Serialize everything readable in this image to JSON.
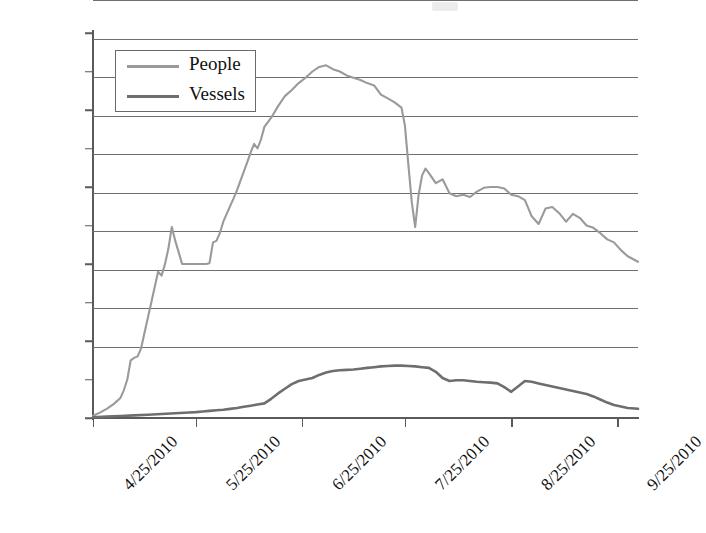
{
  "chart_data": {
    "type": "line",
    "title": "",
    "xlabel": "",
    "ylabel": "",
    "ylim": [
      0,
      50000
    ],
    "ytick_labels": [
      "50000",
      "45000",
      "40000",
      "35000",
      "30000",
      "25000",
      "20000",
      "15000",
      "10000",
      "5000",
      "0"
    ],
    "ytick_values": [
      50000,
      45000,
      40000,
      35000,
      30000,
      25000,
      20000,
      15000,
      10000,
      5000,
      0
    ],
    "xtick_labels": [
      "4/25/2010",
      "5/25/2010",
      "6/25/2010",
      "7/25/2010",
      "8/25/2010",
      "9/25/2010"
    ],
    "xtick_days": [
      0,
      30,
      61,
      91,
      122,
      153
    ],
    "x_range_days": [
      0,
      159
    ],
    "grid": "horizontal",
    "legend_position": "upper-left-inside",
    "legend_entries": [
      "People",
      "Vessels"
    ],
    "colors": {
      "people": "#9a9a9a",
      "vessels": "#6e6e6e",
      "grid": "#6f6f6f",
      "axis": "#5a5a5a"
    },
    "series": [
      {
        "name": "People",
        "color": "#9a9a9a",
        "x": [
          0,
          2,
          4,
          6,
          8,
          9,
          10,
          11,
          12,
          13,
          14,
          15,
          16,
          17,
          18,
          19,
          20,
          21,
          22,
          23,
          24,
          25,
          26,
          27,
          28,
          29,
          30,
          31,
          32,
          33,
          34,
          35,
          36,
          37,
          38,
          39,
          40,
          41,
          42,
          43,
          44,
          45,
          46,
          47,
          48,
          49,
          50,
          52,
          54,
          56,
          58,
          60,
          62,
          64,
          66,
          68,
          70,
          72,
          74,
          76,
          78,
          80,
          82,
          84,
          86,
          88,
          90,
          91,
          92,
          93,
          94,
          95,
          96,
          97,
          98,
          100,
          102,
          104,
          106,
          108,
          110,
          112,
          114,
          116,
          118,
          120,
          122,
          124,
          126,
          128,
          130,
          132,
          134,
          136,
          138,
          140,
          142,
          144,
          146,
          148,
          150,
          152,
          154,
          156,
          159
        ],
        "values": [
          300,
          700,
          1200,
          1800,
          2600,
          3600,
          5000,
          7500,
          7800,
          8000,
          9000,
          11000,
          13000,
          15000,
          17000,
          19000,
          18500,
          20000,
          22000,
          24800,
          23000,
          21500,
          20000,
          20000,
          20000,
          20000,
          20000,
          20000,
          20000,
          20000,
          20100,
          22800,
          23000,
          24000,
          25500,
          26500,
          27500,
          28500,
          29600,
          30800,
          32000,
          33200,
          34500,
          35600,
          35000,
          36200,
          37800,
          39000,
          40500,
          41800,
          42600,
          43500,
          44200,
          45000,
          45600,
          45800,
          45300,
          45000,
          44500,
          44200,
          43900,
          43500,
          43200,
          42000,
          41500,
          41000,
          40300,
          38000,
          33000,
          28000,
          24800,
          29000,
          31500,
          32400,
          31800,
          30500,
          31000,
          29200,
          28800,
          29000,
          28700,
          29400,
          29900,
          30000,
          30000,
          29800,
          29000,
          28800,
          28300,
          26200,
          25200,
          27200,
          27400,
          26600,
          25500,
          26500,
          26000,
          25000,
          24700,
          24000,
          23200,
          22800,
          21800,
          21000,
          20300
        ]
      },
      {
        "name": "Vessels",
        "color": "#6e6e6e",
        "x": [
          0,
          4,
          8,
          12,
          16,
          20,
          24,
          28,
          30,
          32,
          34,
          36,
          38,
          40,
          42,
          44,
          46,
          48,
          50,
          52,
          54,
          56,
          58,
          60,
          62,
          64,
          66,
          68,
          70,
          72,
          74,
          76,
          78,
          80,
          82,
          84,
          86,
          88,
          90,
          92,
          94,
          96,
          98,
          100,
          102,
          104,
          106,
          108,
          110,
          112,
          114,
          116,
          118,
          120,
          122,
          124,
          126,
          128,
          130,
          132,
          134,
          136,
          138,
          140,
          142,
          144,
          146,
          148,
          150,
          152,
          154,
          156,
          159
        ],
        "values": [
          100,
          180,
          260,
          340,
          420,
          520,
          620,
          720,
          760,
          840,
          920,
          1000,
          1080,
          1180,
          1300,
          1450,
          1600,
          1750,
          1900,
          2500,
          3200,
          3800,
          4400,
          4800,
          5000,
          5200,
          5600,
          5900,
          6100,
          6200,
          6250,
          6300,
          6400,
          6500,
          6600,
          6700,
          6750,
          6800,
          6800,
          6750,
          6700,
          6600,
          6500,
          6000,
          5200,
          4800,
          4900,
          4900,
          4800,
          4700,
          4650,
          4600,
          4500,
          4000,
          3400,
          4100,
          4800,
          4700,
          4500,
          4300,
          4100,
          3900,
          3700,
          3500,
          3300,
          3100,
          2800,
          2400,
          2000,
          1700,
          1500,
          1300,
          1200
        ]
      }
    ]
  }
}
